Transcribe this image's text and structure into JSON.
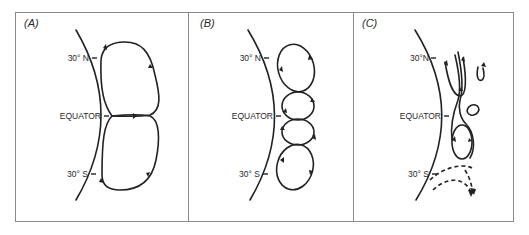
{
  "figure": {
    "panels": [
      {
        "id": "A",
        "label": "(A)",
        "latitude_labels": {
          "north": "30° N",
          "equator": "EQUATOR",
          "south": "30° S"
        },
        "cells": 2
      },
      {
        "id": "B",
        "label": "(B)",
        "latitude_labels": {
          "north": "30° N",
          "equator": "EQUATOR",
          "south": "30° S"
        },
        "cells": 4
      },
      {
        "id": "C",
        "label": "(C)",
        "latitude_labels": {
          "north": "30°N",
          "equator": "EQUATOR",
          "south": "30° S"
        },
        "cells": "streamlines, small eddy, single cell, dashed southern flow"
      }
    ],
    "colors": {
      "line": "#222222",
      "frame": "#8a8a8a",
      "background": "#ffffff"
    }
  }
}
